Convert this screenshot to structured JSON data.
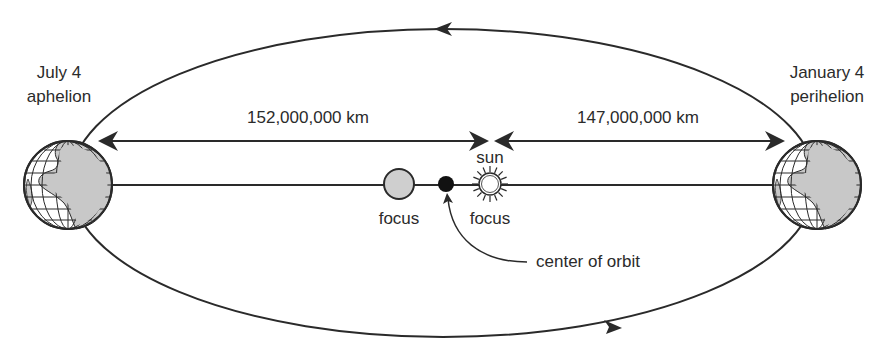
{
  "diagram": {
    "type": "earth-orbit-ellipse",
    "aphelion": {
      "date": "July 4",
      "name": "aphelion",
      "distance_label": "152,000,000 km"
    },
    "perihelion": {
      "date": "January 4",
      "name": "perihelion",
      "distance_label": "147,000,000 km"
    },
    "sun_label": "sun",
    "focus_labels": [
      "focus",
      "focus"
    ],
    "center_label": "center of orbit",
    "orbit_direction": "counterclockwise",
    "colors": {
      "line": "#2a2a2a",
      "land": "#c8c8c8",
      "focus_fill": "#cfcfcf",
      "center_fill": "#111111",
      "background": "#ffffff"
    }
  }
}
